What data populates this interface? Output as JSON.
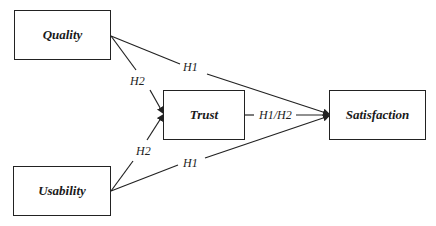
{
  "diagram": {
    "nodes": [
      {
        "id": "quality",
        "label": "Quality"
      },
      {
        "id": "usability",
        "label": "Usability"
      },
      {
        "id": "trust",
        "label": "Trust"
      },
      {
        "id": "satisfaction",
        "label": "Satisfaction"
      }
    ],
    "edges": [
      {
        "from": "quality",
        "to": "satisfaction",
        "label": "H1"
      },
      {
        "from": "quality",
        "to": "trust",
        "label": "H2"
      },
      {
        "from": "usability",
        "to": "trust",
        "label": "H2"
      },
      {
        "from": "usability",
        "to": "satisfaction",
        "label": "H1"
      },
      {
        "from": "trust",
        "to": "satisfaction",
        "label": "H1/H2"
      }
    ]
  }
}
